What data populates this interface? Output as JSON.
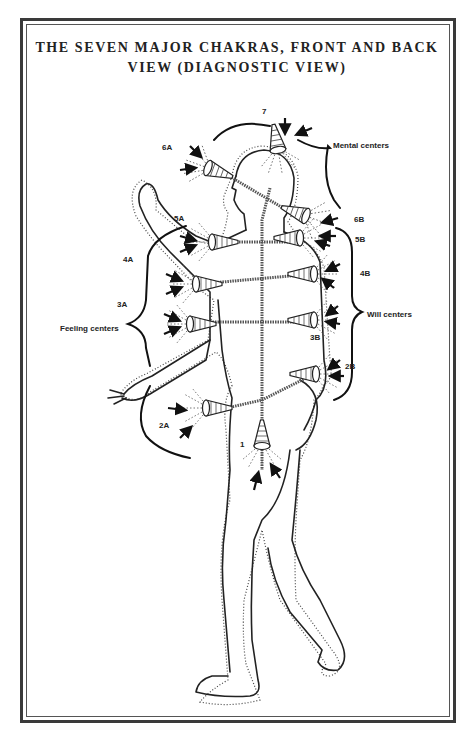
{
  "title": {
    "line1": "THE SEVEN MAJOR CHAKRAS, FRONT AND BACK",
    "line2": "VIEW (DIAGNOSTIC VIEW)"
  },
  "groups": {
    "mental": "Mental centers",
    "will": "Will centers",
    "feeling": "Feeling centers"
  },
  "chakras": {
    "c7": "7",
    "c6a": "6A",
    "c6b": "6B",
    "c5a": "5A",
    "c5b": "5B",
    "c4a": "4A",
    "c4b": "4B",
    "c3a": "3A",
    "c3b": "3B",
    "c2a": "2A",
    "c2b": "2B",
    "c1": "1"
  },
  "colors": {
    "ink": "#222222",
    "paper": "#ffffff",
    "frame": "#3a3a3a"
  }
}
